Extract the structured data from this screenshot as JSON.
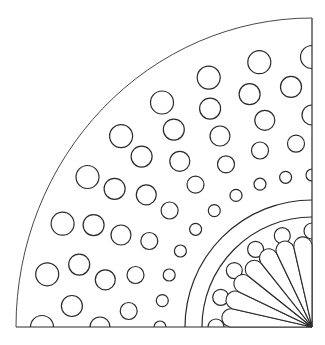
{
  "diagram": {
    "type": "quarter-circle-pattern",
    "canvas": {
      "width": 325,
      "height": 345
    },
    "center": {
      "x": 312,
      "y": 327
    },
    "colors": {
      "line": "#2a2a2a",
      "background": "#ffffff"
    },
    "outer_arc": {
      "rx": 296,
      "ry": 309
    },
    "inner_arcs": [
      {
        "r": 127
      },
      {
        "r": 110
      }
    ],
    "circle_rings": [
      {
        "name": "ring-1",
        "radius": 270,
        "circle_r": 11.5,
        "count": 9,
        "start_deg": 0,
        "end_deg": 90
      },
      {
        "name": "ring-2",
        "radius": 241,
        "circle_r": 10.5,
        "count": 9,
        "start_deg": 5,
        "end_deg": 85
      },
      {
        "name": "ring-3",
        "radius": 212,
        "circle_r": 10,
        "count": 8,
        "start_deg": 0,
        "end_deg": 90
      },
      {
        "name": "ring-4",
        "radius": 184,
        "circle_r": 8.5,
        "count": 8,
        "start_deg": 5,
        "end_deg": 85
      },
      {
        "name": "ring-5",
        "radius": 152,
        "circle_r": 6,
        "count": 10,
        "start_deg": 0,
        "end_deg": 90
      },
      {
        "name": "ring-inner",
        "radius": 96,
        "circle_r": 8,
        "count": 6,
        "start_deg": 0,
        "end_deg": 90
      }
    ],
    "fan": {
      "petal_count": 7,
      "length": 82,
      "petal_width_deg": 12.8
    }
  }
}
